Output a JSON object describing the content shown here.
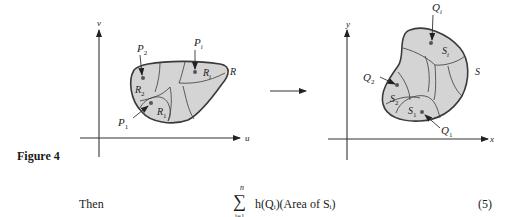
{
  "figure": {
    "caption": "Figure 4",
    "left_plot": {
      "vertical_axis_label": "v",
      "horizontal_axis_label": "u",
      "region_label": "R",
      "subregion_labels": [
        "R",
        "R",
        "R"
      ],
      "subregion_subscripts": [
        "1",
        "2",
        "i"
      ],
      "point_labels": [
        "P",
        "P",
        "P"
      ],
      "point_subscripts": [
        "1",
        "2",
        "i"
      ]
    },
    "mapping": {
      "label": "F"
    },
    "right_plot": {
      "vertical_axis_label": "y",
      "horizontal_axis_label": "x",
      "region_label": "S",
      "subregion_labels": [
        "S",
        "S",
        "S"
      ],
      "subregion_subscripts": [
        "1",
        "2",
        "i"
      ],
      "point_labels": [
        "Q",
        "Q",
        "Q"
      ],
      "point_subscripts": [
        "1",
        "2",
        "i"
      ]
    },
    "colors": {
      "region_fill": "#d4d4d4",
      "stroke": "#3a3a3a",
      "point": "#555555"
    }
  },
  "equation": {
    "lead_word": "Then",
    "sum_symbol": "∑",
    "upper_limit": "n",
    "lower_limit": "i=1",
    "expression": "h(Qᵢ)(Area of Sᵢ)",
    "number": "(5)"
  }
}
